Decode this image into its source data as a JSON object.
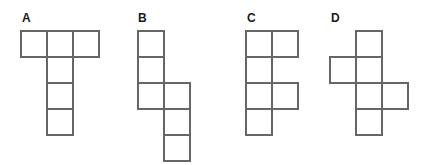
{
  "figure": {
    "background_color": "#ffffff",
    "line_color": "#666666",
    "cell_fill_color": "#ffffff",
    "label_color": "#1a1a1a",
    "cell_size": 26,
    "width": 421,
    "height": 165
  },
  "panels": [
    {
      "label": "A",
      "label_x": 22,
      "label_y": 12,
      "origin_x": 21,
      "origin_y": 31,
      "description": "three cells in a top row with three cells descending from the middle column",
      "cells": [
        {
          "col": 0,
          "row": 0
        },
        {
          "col": 1,
          "row": 0
        },
        {
          "col": 2,
          "row": 0
        },
        {
          "col": 1,
          "row": 1
        },
        {
          "col": 1,
          "row": 2
        },
        {
          "col": 1,
          "row": 3
        }
      ]
    },
    {
      "label": "B",
      "label_x": 138,
      "label_y": 12,
      "origin_x": 138,
      "origin_y": 31,
      "description": "left column of three cells joined to a right column of three cells offset down by two rows",
      "cells": [
        {
          "col": 0,
          "row": 0
        },
        {
          "col": 0,
          "row": 1
        },
        {
          "col": 0,
          "row": 2
        },
        {
          "col": 1,
          "row": 2
        },
        {
          "col": 1,
          "row": 3
        },
        {
          "col": 1,
          "row": 4
        }
      ]
    },
    {
      "label": "C",
      "label_x": 247,
      "label_y": 12,
      "origin_x": 246,
      "origin_y": 31,
      "description": "left column of four cells with right-hand cells at the first and third rows",
      "cells": [
        {
          "col": 0,
          "row": 0
        },
        {
          "col": 1,
          "row": 0
        },
        {
          "col": 0,
          "row": 1
        },
        {
          "col": 0,
          "row": 2
        },
        {
          "col": 1,
          "row": 2
        },
        {
          "col": 0,
          "row": 3
        }
      ]
    },
    {
      "label": "D",
      "label_x": 331,
      "label_y": 12,
      "origin_x": 330,
      "origin_y": 31,
      "description": "centre column of four cells with a left cell at the second row and a right cell at the third row",
      "cells": [
        {
          "col": 1,
          "row": 0
        },
        {
          "col": 0,
          "row": 1
        },
        {
          "col": 1,
          "row": 1
        },
        {
          "col": 1,
          "row": 2
        },
        {
          "col": 2,
          "row": 2
        },
        {
          "col": 1,
          "row": 3
        }
      ]
    }
  ]
}
